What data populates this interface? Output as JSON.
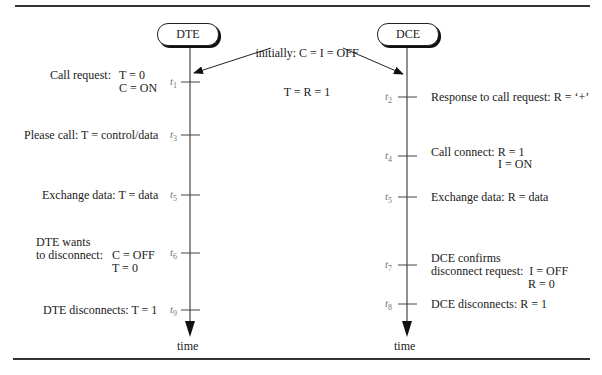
{
  "nodes": {
    "dte": "DTE",
    "dce": "DCE"
  },
  "initial": {
    "line1": "initially: C = I = OFF",
    "line2": "T = R = 1"
  },
  "axis_label": "time",
  "time_marks": {
    "t1": "t",
    "t1_sub": "1",
    "t2": "t",
    "t2_sub": "2",
    "t3": "t",
    "t3_sub": "3",
    "t4": "t",
    "t4_sub": "4",
    "t5_dte": "t",
    "t5_dte_sub": "5",
    "t5_dce": "t",
    "t5_dce_sub": "5",
    "t6": "t",
    "t6_sub": "6",
    "t7": "t",
    "t7_sub": "7",
    "t8": "t",
    "t8_sub": "8",
    "t9": "t",
    "t9_sub": "9"
  },
  "dte_events": [
    {
      "label": "Call request:",
      "values": "T = 0\nC = ON"
    },
    {
      "label": "Please call: T = control/data"
    },
    {
      "label": "Exchange data: T = data"
    },
    {
      "label": "DTE wants\nto disconnect:",
      "values": "C = OFF\nT = 0"
    },
    {
      "label": "DTE disconnects: T = 1"
    }
  ],
  "dce_events": [
    {
      "label": "Response to call request: R = ‘+’"
    },
    {
      "label": "Call connect: R = 1",
      "values": "I = ON"
    },
    {
      "label": "Exchange data: R = data"
    },
    {
      "label": "DCE confirms\ndisconnect request:  I = OFF",
      "values": "R = 0"
    },
    {
      "label": "DCE disconnects: R = 1"
    }
  ]
}
